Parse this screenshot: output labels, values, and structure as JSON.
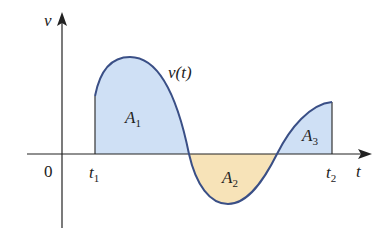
{
  "diagram": {
    "axes": {
      "y_label": "v",
      "x_label": "t",
      "origin_label": "0"
    },
    "curve_label": "v(t)",
    "ticks": [
      {
        "name": "t",
        "sub": "1"
      },
      {
        "name": "t",
        "sub": "2"
      }
    ],
    "regions": [
      {
        "name": "A",
        "sub": "1",
        "sign": "positive",
        "color": "#cfe0f5"
      },
      {
        "name": "A",
        "sub": "2",
        "sign": "negative",
        "color": "#f7e3b8"
      },
      {
        "name": "A",
        "sub": "3",
        "sign": "positive",
        "color": "#cfe0f5"
      }
    ],
    "colors": {
      "curve": "#3a4f86",
      "axis": "#222222",
      "positive_fill": "#cfe0f5",
      "negative_fill": "#f7e3b8"
    }
  }
}
